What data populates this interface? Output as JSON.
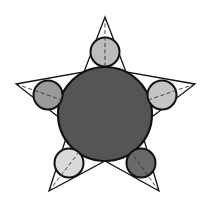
{
  "diagram": {
    "title": "",
    "star": {
      "outer_vertices": [
        [
          105,
          17
        ],
        [
          195,
          84
        ],
        [
          159,
          191
        ],
        [
          49,
          191
        ],
        [
          16,
          84
        ]
      ],
      "inner_vertices": [
        [
          126,
          72
        ],
        [
          140,
          126
        ],
        [
          105,
          161
        ],
        [
          70,
          126
        ],
        [
          84,
          72
        ]
      ],
      "stroke": "#111111"
    },
    "center_circle": {
      "cx": 105,
      "cy": 114,
      "r": 47,
      "fill": "#555555",
      "stroke": "#111111"
    },
    "small_circles": [
      {
        "name": "top",
        "cx": 105,
        "cy": 52,
        "r": 14.5,
        "fill": "#bdbdbd",
        "axis": [
          [
            105,
            17
          ],
          [
            105,
            67
          ]
        ]
      },
      {
        "name": "right",
        "cx": 162,
        "cy": 95,
        "r": 14.5,
        "fill": "#c4c4c4",
        "axis": [
          [
            195,
            84
          ],
          [
            148,
            100
          ]
        ]
      },
      {
        "name": "bottom-right",
        "cx": 141,
        "cy": 163,
        "r": 14.5,
        "fill": "#6a6a6a",
        "axis": [
          [
            159,
            191
          ],
          [
            131,
            152
          ]
        ]
      },
      {
        "name": "bottom-left",
        "cx": 69,
        "cy": 163,
        "r": 14.5,
        "fill": "#d9d9d9",
        "axis": [
          [
            49,
            191
          ],
          [
            79,
            152
          ]
        ]
      },
      {
        "name": "left",
        "cx": 48,
        "cy": 95,
        "r": 14.5,
        "fill": "#9a9a9a",
        "axis": [
          [
            16,
            84
          ],
          [
            62,
            100
          ]
        ]
      }
    ]
  }
}
